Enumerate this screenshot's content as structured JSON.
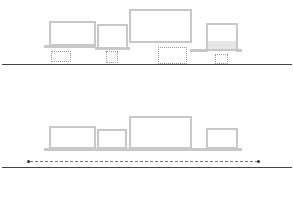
{
  "diagram": {
    "colors": {
      "block_outline": "#c8c8c8",
      "ground_line": "#444444",
      "dotted_outline": "#999999",
      "span_line": "#777777"
    },
    "top_panel": {
      "blocks": [
        {
          "id": "block-1",
          "x": 49,
          "y": 21,
          "w": 47,
          "h": 25
        },
        {
          "id": "block-2",
          "x": 97,
          "y": 24,
          "w": 31,
          "h": 25
        },
        {
          "id": "block-3",
          "x": 129,
          "y": 9,
          "w": 63,
          "h": 34
        },
        {
          "id": "block-4",
          "x": 206,
          "y": 23,
          "w": 32,
          "h": 28
        }
      ],
      "supports_dotted": [
        {
          "id": "support-1",
          "x": 51,
          "y": 51,
          "w": 20,
          "h": 11
        },
        {
          "id": "support-2",
          "x": 106,
          "y": 51,
          "w": 12,
          "h": 12
        },
        {
          "id": "support-3",
          "x": 158,
          "y": 47,
          "w": 29,
          "h": 17
        },
        {
          "id": "support-4",
          "x": 215,
          "y": 54,
          "w": 13,
          "h": 10
        }
      ]
    },
    "bottom_panel": {
      "blocks": [
        {
          "id": "block-1",
          "x": 49,
          "y": 126,
          "w": 47,
          "h": 23
        },
        {
          "id": "block-2",
          "x": 97,
          "y": 129,
          "w": 30,
          "h": 20
        },
        {
          "id": "block-3",
          "x": 129,
          "y": 116,
          "w": 63,
          "h": 33
        },
        {
          "id": "block-4",
          "x": 206,
          "y": 128,
          "w": 32,
          "h": 21
        }
      ],
      "span_indicator": {
        "x1": 28,
        "x2": 259,
        "y": 161,
        "style": "dotted double arrow"
      }
    }
  }
}
